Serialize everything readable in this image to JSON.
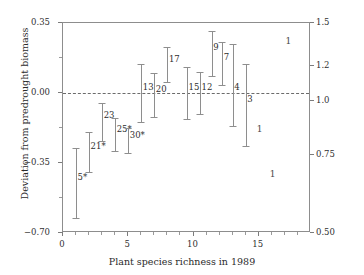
{
  "chart_data": {
    "type": "scatter",
    "title": "",
    "xlabel": "Plant species richness in 1989",
    "ylabel_left": "Deviation from predrought biomass",
    "ylabel_right": "Biomass ratio (log scale)",
    "xlim": [
      0,
      19
    ],
    "ylim_left": [
      -0.7,
      0.35
    ],
    "ylim_right": [
      0.5,
      1.5
    ],
    "grid": false,
    "legend": "none",
    "reference_line": {
      "y_left": 0.0,
      "y_right": 1.0,
      "style": "dashed"
    },
    "xticks": [
      0,
      5,
      10,
      15
    ],
    "xticks_minor_step": 1,
    "yticks_left": [
      0.35,
      0.0,
      -0.35,
      -0.7
    ],
    "yticks_left_labels": [
      "0.35",
      "0.00",
      "−0.35",
      "−0.70"
    ],
    "yticks_right": [
      1.5,
      1.2,
      1.0,
      0.75,
      0.5
    ],
    "yticks_right_labels": [
      "1.5",
      "1.2",
      "1.0",
      "0.75",
      "0.50"
    ],
    "error_bar_points": [
      {
        "label": "5*",
        "x": 1.0,
        "y": -0.45,
        "lo": -0.625,
        "hi": -0.275
      },
      {
        "label": "21*",
        "x": 2.0,
        "y": -0.295,
        "lo": -0.395,
        "hi": -0.195
      },
      {
        "label": "23",
        "x": 3.0,
        "y": -0.14,
        "lo": -0.24,
        "hi": -0.05
      },
      {
        "label": "25*",
        "x": 4.0,
        "y": -0.21,
        "lo": -0.29,
        "hi": -0.125
      },
      {
        "label": "30*",
        "x": 5.0,
        "y": -0.24,
        "lo": -0.3,
        "hi": -0.175
      },
      {
        "label": "13",
        "x": 6.0,
        "y": 0.0,
        "lo": -0.145,
        "hi": 0.145
      },
      {
        "label": "20",
        "x": 7.0,
        "y": -0.01,
        "lo": -0.12,
        "hi": 0.1
      },
      {
        "label": "17",
        "x": 8.0,
        "y": 0.14,
        "lo": 0.055,
        "hi": 0.23
      },
      {
        "label": "15",
        "x": 9.5,
        "y": 0.0,
        "lo": -0.13,
        "hi": 0.13
      },
      {
        "label": "12",
        "x": 10.5,
        "y": 0.0,
        "lo": -0.105,
        "hi": 0.105
      },
      {
        "label": "9",
        "x": 11.4,
        "y": 0.2,
        "lo": 0.085,
        "hi": 0.31
      },
      {
        "label": "7",
        "x": 12.2,
        "y": 0.15,
        "lo": 0.04,
        "hi": 0.255
      },
      {
        "label": "4",
        "x": 13.0,
        "y": 0.0,
        "lo": -0.165,
        "hi": 0.245
      },
      {
        "label": "3",
        "x": 14.0,
        "y": -0.06,
        "lo": -0.265,
        "hi": 0.145
      }
    ],
    "single_observations": [
      {
        "label": "1",
        "x": 17.2,
        "y": 0.26
      },
      {
        "label": "1",
        "x": 15.0,
        "y": -0.18
      },
      {
        "label": "1",
        "x": 16.0,
        "y": -0.405
      }
    ]
  },
  "axes": {
    "left_label": "Deviation from predrought biomass",
    "right_label": "Biomass ratio (log scale)",
    "bottom_label": "Plant species richness in 1989"
  }
}
